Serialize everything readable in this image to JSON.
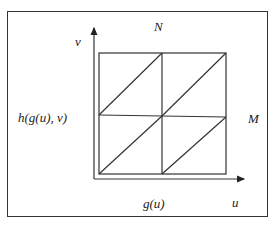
{
  "diagram": {
    "labels": {
      "top": "N",
      "y_axis": "v",
      "left": "h(g(u), v)",
      "right": "M",
      "bottom": "g(u)",
      "x_axis": "u"
    },
    "grid": {
      "rows": 2,
      "cols": 2,
      "diagonals": "bottom-left to top-right in each cell"
    },
    "colors": {
      "stroke": "#333333",
      "background": "#ffffff"
    }
  }
}
